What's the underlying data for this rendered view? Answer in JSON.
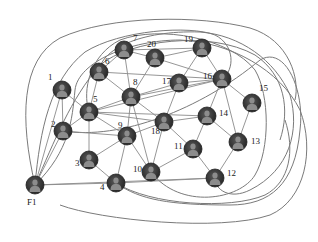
{
  "diagram": {
    "type": "network-graph",
    "node_icon": "user-avatar-icon",
    "colors": {
      "node_fill": "#3a3a3a",
      "node_ring": "#1f1f1f",
      "avatar": "#8c8c8c",
      "edge": "#8a8a8a",
      "label": "#222222"
    },
    "nodes": [
      {
        "id": "1",
        "label": "1",
        "x": 62,
        "y": 90,
        "lx": 48,
        "ly": 80
      },
      {
        "id": "2",
        "label": "2",
        "x": 63,
        "y": 131,
        "lx": 51,
        "ly": 127
      },
      {
        "id": "3",
        "label": "3",
        "x": 89,
        "y": 160,
        "lx": 75,
        "ly": 166
      },
      {
        "id": "4",
        "label": "4",
        "x": 116,
        "y": 183,
        "lx": 100,
        "ly": 190
      },
      {
        "id": "5",
        "label": "5",
        "x": 89,
        "y": 112,
        "lx": 93,
        "ly": 102
      },
      {
        "id": "6",
        "label": "6",
        "x": 99,
        "y": 72,
        "lx": 105,
        "ly": 64
      },
      {
        "id": "7",
        "label": "7",
        "x": 124,
        "y": 50,
        "lx": 133,
        "ly": 41
      },
      {
        "id": "8",
        "label": "8",
        "x": 131,
        "y": 97,
        "lx": 133,
        "ly": 85
      },
      {
        "id": "9",
        "label": "9",
        "x": 127,
        "y": 136,
        "lx": 118,
        "ly": 128
      },
      {
        "id": "10",
        "label": "10",
        "x": 151,
        "y": 172,
        "lx": 133,
        "ly": 172
      },
      {
        "id": "11",
        "label": "11",
        "x": 193,
        "y": 149,
        "lx": 174,
        "ly": 149
      },
      {
        "id": "12",
        "label": "12",
        "x": 215,
        "y": 178,
        "lx": 227,
        "ly": 176
      },
      {
        "id": "13",
        "label": "13",
        "x": 238,
        "y": 142,
        "lx": 251,
        "ly": 144
      },
      {
        "id": "14",
        "label": "14",
        "x": 207,
        "y": 116,
        "lx": 219,
        "ly": 116
      },
      {
        "id": "15",
        "label": "15",
        "x": 252,
        "y": 103,
        "lx": 259,
        "ly": 91
      },
      {
        "id": "16",
        "label": "16",
        "x": 222,
        "y": 79,
        "lx": 203,
        "ly": 79
      },
      {
        "id": "17",
        "label": "17",
        "x": 179,
        "y": 83,
        "lx": 162,
        "ly": 84
      },
      {
        "id": "18",
        "label": "18",
        "x": 164,
        "y": 122,
        "lx": 151,
        "ly": 134
      },
      {
        "id": "19",
        "label": "19",
        "x": 202,
        "y": 48,
        "lx": 184,
        "ly": 42
      },
      {
        "id": "20",
        "label": "20",
        "x": 155,
        "y": 58,
        "lx": 147,
        "ly": 47
      },
      {
        "id": "F1",
        "label": "F1",
        "x": 35,
        "y": 185,
        "lx": 27,
        "ly": 205
      }
    ],
    "edges": [
      [
        "1",
        "2"
      ],
      [
        "1",
        "5"
      ],
      [
        "1",
        "F1"
      ],
      [
        "2",
        "5"
      ],
      [
        "2",
        "9"
      ],
      [
        "2",
        "F1"
      ],
      [
        "3",
        "4"
      ],
      [
        "3",
        "9"
      ],
      [
        "3",
        "5"
      ],
      [
        "4",
        "9"
      ],
      [
        "4",
        "12"
      ],
      [
        "5",
        "6"
      ],
      [
        "5",
        "8"
      ],
      [
        "5",
        "9"
      ],
      [
        "5",
        "16"
      ],
      [
        "5",
        "14"
      ],
      [
        "5",
        "18"
      ],
      [
        "6",
        "8"
      ],
      [
        "6",
        "16"
      ],
      [
        "6",
        "7"
      ],
      [
        "7",
        "8"
      ],
      [
        "7",
        "20"
      ],
      [
        "7",
        "19"
      ],
      [
        "8",
        "9"
      ],
      [
        "8",
        "10"
      ],
      [
        "8",
        "20"
      ],
      [
        "8",
        "16"
      ],
      [
        "8",
        "17"
      ],
      [
        "8",
        "18"
      ],
      [
        "9",
        "10"
      ],
      [
        "9",
        "18"
      ],
      [
        "10",
        "11"
      ],
      [
        "10",
        "18"
      ],
      [
        "11",
        "12"
      ],
      [
        "11",
        "18"
      ],
      [
        "11",
        "14"
      ],
      [
        "12",
        "13"
      ],
      [
        "13",
        "14"
      ],
      [
        "13",
        "15"
      ],
      [
        "13",
        "16"
      ],
      [
        "14",
        "16"
      ],
      [
        "14",
        "18"
      ],
      [
        "15",
        "16"
      ],
      [
        "16",
        "19"
      ],
      [
        "16",
        "17"
      ],
      [
        "16",
        "20"
      ],
      [
        "17",
        "18"
      ],
      [
        "17",
        "19"
      ],
      [
        "19",
        "20"
      ],
      [
        "F1",
        "12"
      ],
      [
        "F1",
        "4"
      ]
    ],
    "curves": [
      "M35,185 C20,120 20,60 60,38 C110,15 200,15 250,28 C290,40 300,80 295,100",
      "M35,185 C40,130 50,80 85,52 C120,30 190,25 215,35 C235,45 235,70 222,79",
      "M35,185 C55,140 70,100 100,65 C130,40 210,30 255,55 C285,75 290,110 280,140",
      "M35,185 C70,150 72,120 75,90 C78,62 130,40 180,40 C230,42 280,70 300,110 C315,150 305,200 270,215 C220,232 100,220 60,205",
      "M116,183 C150,205 230,210 265,195 C290,182 295,150 285,120",
      "M63,131 C120,140 200,110 260,60 C285,45 305,90 300,130 C295,185 270,205 230,205 C170,205 140,200 116,183",
      "M99,72 C100,50 140,30 200,32 C240,35 275,60 290,95 C300,130 290,170 250,190 C230,200 215,190 215,178",
      "M89,112 C82,90 90,55 120,40 C160,25 230,38 255,70 C270,95 270,150 255,175 C240,200 180,210 151,172"
    ]
  }
}
